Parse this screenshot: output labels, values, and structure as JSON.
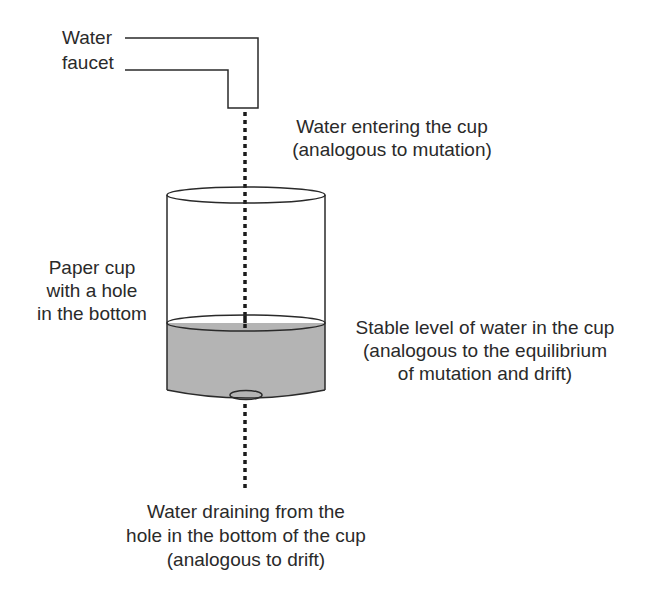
{
  "diagram": {
    "labels": {
      "faucet": {
        "line1": "Water",
        "line2": "faucet"
      },
      "water_entering": {
        "line1": "Water entering the cup",
        "line2": "(analogous to mutation)"
      },
      "paper_cup": {
        "line1": "Paper cup",
        "line2": "with a hole",
        "line3": "in the bottom"
      },
      "stable_level": {
        "line1": "Stable level of water in the cup",
        "line2": "(analogous to the equilibrium",
        "line3": "of mutation and drift)"
      },
      "water_draining": {
        "line1": "Water draining from the",
        "line2": "hole in the bottom of the cup",
        "line3": "(analogous to drift)"
      }
    },
    "colors": {
      "line": "#2a2a2a",
      "water_fill": "#b4b4b4",
      "water_surface": "#cdcdcd",
      "background": "#ffffff"
    }
  }
}
